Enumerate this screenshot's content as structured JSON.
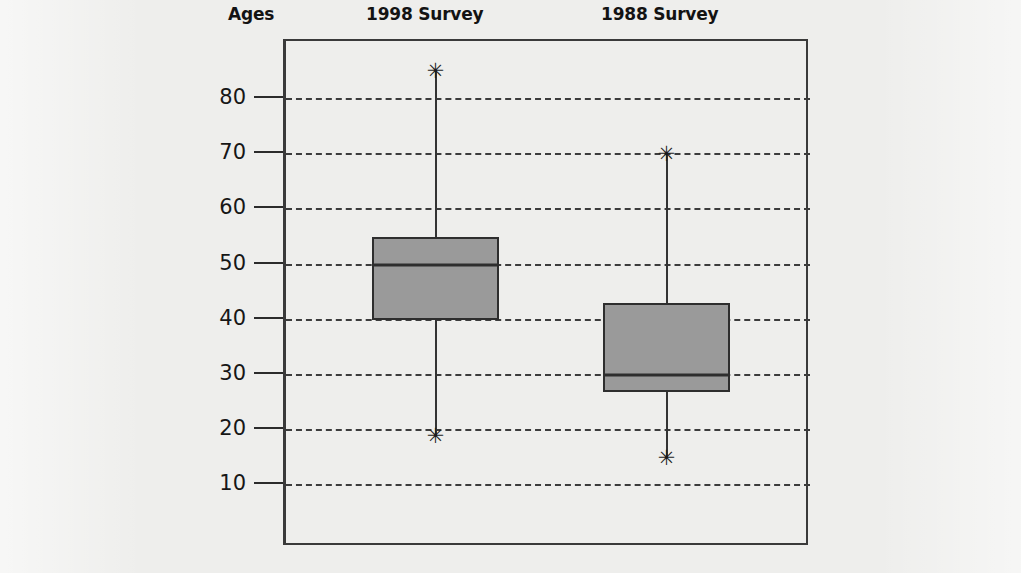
{
  "headings": {
    "axis_title": "Ages",
    "series_1": "1998 Survey",
    "series_2": "1988 Survey"
  },
  "axis": {
    "ticks": [
      "80",
      "70",
      "60",
      "50",
      "40",
      "30",
      "20",
      "10"
    ]
  },
  "style": {
    "box_fill": "#9a9a9a",
    "line_color": "#2e2e2e",
    "grid_color": "#3c3c3c",
    "page_background": "#eeeeec"
  },
  "chart_data": {
    "type": "box",
    "title": "Ages",
    "xlabel": "",
    "ylabel": "Ages",
    "ylim": [
      0,
      90
    ],
    "yticks": [
      10,
      20,
      30,
      40,
      50,
      60,
      70,
      80
    ],
    "grid": true,
    "legend": "none",
    "categories": [
      "1998 Survey",
      "1988 Survey"
    ],
    "series": [
      {
        "name": "1998 Survey",
        "min": 19,
        "q1": 40,
        "median": 50,
        "q3": 55,
        "max": 85,
        "outlier_markers": [
          "min",
          "max"
        ]
      },
      {
        "name": "1988 Survey",
        "min": 15,
        "q1": 27,
        "median": 30,
        "q3": 43,
        "max": 70,
        "outlier_markers": [
          "min",
          "max"
        ]
      }
    ]
  }
}
